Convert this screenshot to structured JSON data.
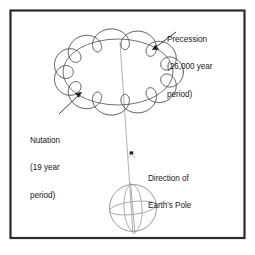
{
  "figure": {
    "kind": "astronomy-diagram",
    "title_visible": false,
    "background_color": "#ffffff",
    "frame_color": "#2b2b2b",
    "curve_color": "#4a4a4a",
    "axis_color": "#9a9a9a",
    "earth_color": "#8e8e8e",
    "text_color": "#1a1a1a"
  },
  "labels": {
    "precession": {
      "line1": "Precession",
      "line2": "(26,000 year",
      "line3": "period)"
    },
    "nutation": {
      "line1": "Nutation",
      "line2": "(19 year",
      "line3": "period)"
    },
    "direction": {
      "line1": "Direction of",
      "line2": "Earth's Pole"
    }
  },
  "chart_data": {
    "type": "line",
    "series": [
      {
        "name": "Precession",
        "description": "Smooth elliptical path traced by Earth's pole",
        "period_years": 26000,
        "period_label": "26,000 year period",
        "center": [
          118,
          72
        ],
        "radius_x": 55,
        "radius_y": 33
      },
      {
        "name": "Nutation",
        "description": "Small wavy oscillation superimposed on the precession circle",
        "period_years": 19,
        "period_label": "19 year period",
        "lobes": 12,
        "amplitude": 9
      }
    ],
    "annotations": [
      {
        "text": "Precession (26,000 year period)",
        "points_to": [
          151,
          50
        ]
      },
      {
        "text": "Nutation (19 year period)",
        "points_to": [
          80,
          93
        ]
      },
      {
        "text": "Direction of Earth's Pole",
        "points_to": [
          132,
          153
        ]
      }
    ],
    "objects": [
      {
        "name": "earth",
        "shape": "sphere",
        "center": [
          133,
          208
        ],
        "radius": 23
      },
      {
        "name": "pole-axis",
        "shape": "line",
        "from": [
          120,
          42
        ],
        "to": [
          133,
          234
        ]
      }
    ],
    "xlabel": "",
    "ylabel": "",
    "grid": false,
    "legend": "none"
  }
}
